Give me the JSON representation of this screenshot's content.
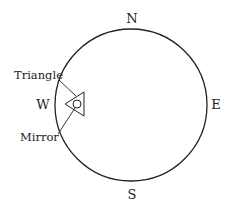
{
  "compass": {
    "north": "N",
    "east": "E",
    "south": "S",
    "west": "W"
  },
  "labels": {
    "triangle": "Triangle",
    "mirror": "Mirror"
  },
  "colors": {
    "stroke": "#222222",
    "background": "#ffffff"
  }
}
